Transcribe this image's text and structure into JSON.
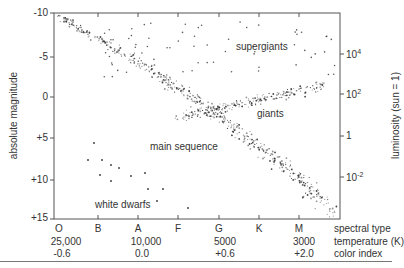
{
  "chart_data": {
    "type": "scatter",
    "title": "",
    "xlabel_rows": [
      "spectral type",
      "temperature (K)",
      "color index"
    ],
    "ylabel_left": "absolute magnitude",
    "ylabel_right": "luminosity (sun = 1)",
    "left_axis": {
      "ticks": [
        "-10",
        "-5",
        "0",
        "+5",
        "+10",
        "+15"
      ],
      "range": [
        -10,
        15
      ],
      "inverted": true
    },
    "right_axis": {
      "ticks": [
        "10^4",
        "10^2",
        "1",
        "10^-2"
      ]
    },
    "spectral_types": [
      "O",
      "B",
      "A",
      "F",
      "G",
      "K",
      "M"
    ],
    "temperature_labels": [
      {
        "at": "O",
        "label": "25,000"
      },
      {
        "at": "A",
        "label": "10,000"
      },
      {
        "at": "G",
        "label": "5000"
      },
      {
        "at": "M",
        "label": "3000"
      }
    ],
    "color_index_labels": [
      {
        "at": "O",
        "label": "-0.6"
      },
      {
        "at": "A",
        "label": "0.0"
      },
      {
        "at": "G",
        "label": "+0.6"
      },
      {
        "at": "M",
        "label": "+2.0"
      }
    ],
    "annotations": [
      "supergiants",
      "giants",
      "main sequence",
      "white dwarfs"
    ],
    "grid": false,
    "regions": [
      {
        "name": "main sequence",
        "description": "diagonal band from O (mag ~ -10) down to M (mag ~ +14)"
      },
      {
        "name": "giants",
        "description": "branch from G/K to M at mag ~ -2 to +1"
      },
      {
        "name": "supergiants",
        "description": "sparse stars across spectral types at mag ~ -8 to -4"
      },
      {
        "name": "white dwarfs",
        "description": "sparse stars in lower left at mag ~ +7 to +14, types B to G"
      }
    ]
  },
  "labels": {
    "ylabel_left": "absolute magnitude",
    "ylabel_right": "luminosity (sun = 1)",
    "row_spectral": "spectral type",
    "row_temp": "temperature (K)",
    "row_color": "color index",
    "supergiants": "supergiants",
    "giants": "giants",
    "main_sequence": "main sequence",
    "white_dwarfs": "white dwarfs"
  },
  "left_ticks": [
    "-10",
    "-5",
    "0",
    "+5",
    "+10",
    "+15"
  ],
  "right_ticks": [
    "10",
    "10",
    "1",
    "10"
  ],
  "right_exps": [
    "4",
    "2",
    "",
    "-2"
  ],
  "spectral": [
    "O",
    "B",
    "A",
    "F",
    "G",
    "K",
    "M"
  ],
  "temps": [
    "25,000",
    "10,000",
    "5000",
    "3000"
  ],
  "colors_idx": [
    "-0.6",
    "0.0",
    "+0.6",
    "+2.0"
  ]
}
